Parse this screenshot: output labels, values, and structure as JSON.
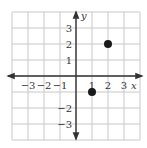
{
  "chart_data": {
    "type": "scatter",
    "title": "",
    "xlabel": "x",
    "ylabel": "y",
    "xlim": [
      -4,
      4
    ],
    "ylim": [
      -4,
      4
    ],
    "grid": true,
    "x_tick_labels": [
      "−3",
      "−2",
      "−1",
      "1",
      "2",
      "3"
    ],
    "x_tick_values": [
      -3,
      -2,
      -1,
      1,
      2,
      3
    ],
    "y_tick_labels": [
      "3",
      "2",
      "1",
      "−2",
      "−3"
    ],
    "y_tick_values": [
      3,
      2,
      1,
      -2,
      -3
    ],
    "points": [
      {
        "x": 2,
        "y": 2
      },
      {
        "x": 1,
        "y": -1
      }
    ]
  },
  "colors": {
    "grid": "#c8c8c8",
    "axis": "#333333",
    "point": "#1a1a1a"
  }
}
